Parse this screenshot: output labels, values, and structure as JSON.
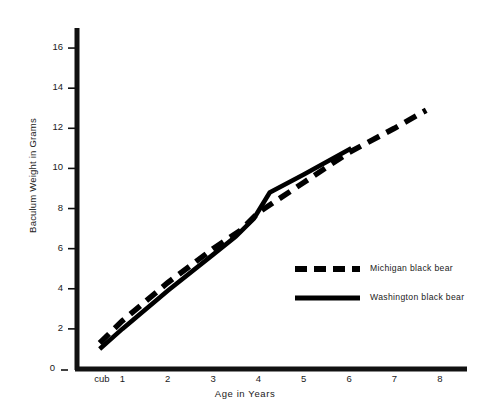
{
  "chart_data": {
    "type": "line",
    "title": "",
    "xlabel": "Age in Years",
    "ylabel": "Baculum Weight in Grams",
    "xtick_labels": [
      "cub",
      "1",
      "2",
      "3",
      "4",
      "5",
      "6",
      "7",
      "8"
    ],
    "ytick_labels": [
      "0",
      "2",
      "4",
      "6",
      "8",
      "10",
      "12",
      "14",
      "16"
    ],
    "xlim": [
      0,
      8.6
    ],
    "ylim": [
      0,
      17
    ],
    "grid": false,
    "legend_position": "center-right",
    "series": [
      {
        "name": "Michigan black bear",
        "style": "dashed",
        "color": "#000000",
        "points": [
          {
            "x": 0.5,
            "y": 1.3
          },
          {
            "x": 1.0,
            "y": 2.4
          },
          {
            "x": 2.0,
            "y": 4.3
          },
          {
            "x": 3.0,
            "y": 6.0
          },
          {
            "x": 3.6,
            "y": 6.9
          },
          {
            "x": 4.0,
            "y": 7.8
          },
          {
            "x": 5.0,
            "y": 9.3
          },
          {
            "x": 6.0,
            "y": 10.8
          },
          {
            "x": 7.0,
            "y": 12.0
          },
          {
            "x": 7.7,
            "y": 12.9
          }
        ]
      },
      {
        "name": "Washington black bear",
        "style": "solid",
        "color": "#000000",
        "points": [
          {
            "x": 0.5,
            "y": 1.0
          },
          {
            "x": 1.0,
            "y": 2.0
          },
          {
            "x": 2.0,
            "y": 3.9
          },
          {
            "x": 3.0,
            "y": 5.7
          },
          {
            "x": 3.5,
            "y": 6.6
          },
          {
            "x": 3.9,
            "y": 7.5
          },
          {
            "x": 4.25,
            "y": 8.8
          },
          {
            "x": 5.0,
            "y": 9.7
          },
          {
            "x": 6.05,
            "y": 11.0
          }
        ]
      }
    ],
    "legend": [
      {
        "label": "Michigan black bear",
        "style": "dashed"
      },
      {
        "label": "Washington black bear",
        "style": "solid"
      }
    ]
  },
  "axes": {
    "y_zero_tick_dash": "–"
  }
}
